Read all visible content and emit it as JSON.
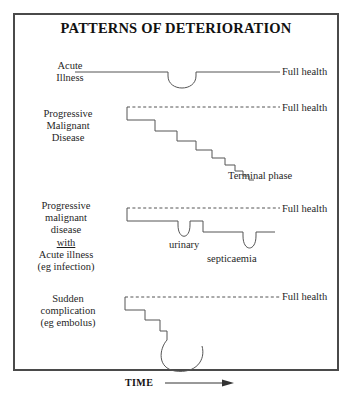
{
  "figure": {
    "title": "PATTERNS OF DETERIORATION",
    "axis": {
      "time_label": "TIME",
      "arrow_icon": "right-arrow-icon"
    },
    "border_color": "#4a4a4a",
    "line_color": "#555555",
    "text_color": "#1f1f1f"
  },
  "panels": [
    {
      "id": "acute-illness",
      "label_lines": [
        "Acute",
        "Illness"
      ],
      "baseline_label": "Full health",
      "baseline_style": "solid",
      "shape": "single-dip-recovery"
    },
    {
      "id": "progressive-malignant-disease",
      "label_lines": [
        "Progressive",
        "Malignant",
        "Disease"
      ],
      "baseline_label": "Full health",
      "baseline_style": "dashed",
      "shape": "descending-staircase",
      "end_label": "Terminal phase",
      "steps": 8
    },
    {
      "id": "progressive-malignant-disease-with-acute-illness",
      "label_lines": [
        "Progressive",
        "malignant",
        "disease",
        "with",
        "Acute illness",
        "(eg infection)"
      ],
      "underlined_line": "with",
      "baseline_label": "Full health",
      "baseline_style": "dashed",
      "shape": "stepwise-with-acute-dips",
      "dip_labels": [
        "urinary",
        "septicaemia"
      ]
    },
    {
      "id": "sudden-complication",
      "label_lines": [
        "Sudden",
        "complication",
        "(eg embolus)"
      ],
      "baseline_label": "Full health",
      "baseline_style": "dashed",
      "shape": "staircase-then-collapse-hook"
    }
  ]
}
